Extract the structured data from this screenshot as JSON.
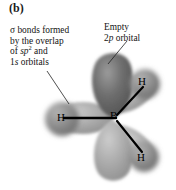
{
  "figure": {
    "panel_label": "(b)",
    "background_color": "#ffffff",
    "width": 176,
    "height": 190
  },
  "captions": {
    "left": {
      "name": "sigma-bond-caption",
      "lines": [
        {
          "prefix": "σ bonds formed",
          "italic": "",
          "sup": "",
          "suffix": ""
        },
        {
          "prefix": "by the overlap",
          "italic": "",
          "sup": "",
          "suffix": ""
        },
        {
          "prefix": "of ",
          "italic": "sp",
          "sup": "2",
          "suffix": " and"
        },
        {
          "prefix": "1",
          "italic": "s",
          "sup": "",
          "suffix": " orbitals"
        }
      ],
      "plain_text": "σ bonds formed by the overlap of sp2 and 1s orbitals"
    },
    "right": {
      "name": "empty-p-orbital-caption",
      "lines": [
        {
          "prefix": "Empty",
          "italic": "",
          "sup": "",
          "suffix": ""
        },
        {
          "prefix": "2",
          "italic": "p",
          "sup": "",
          "suffix": " orbital"
        }
      ],
      "plain_text": "Empty 2p orbital"
    }
  },
  "molecule": {
    "name": "boron-trihydride-sp2-orbital-diagram",
    "central_atom": {
      "label": "B",
      "x": 115,
      "y": 117
    },
    "hydrogens": [
      {
        "label": "H",
        "position": "left",
        "x": 62,
        "y": 117
      },
      {
        "label": "H",
        "position": "upper-right",
        "x": 143,
        "y": 82
      },
      {
        "label": "H",
        "position": "lower-right",
        "x": 142,
        "y": 158
      }
    ],
    "orbitals": {
      "p_orbital": {
        "label": "2p",
        "lobes": [
          "up",
          "down"
        ],
        "fill": "#6e6e6e",
        "state": "empty"
      },
      "sp2_orbitals": {
        "label": "sp2",
        "count": 3,
        "fill": "#a8a8a8"
      },
      "s_orbitals": {
        "label": "1s",
        "count": 3,
        "fill": "#9a9a9a"
      }
    },
    "bonds": [
      {
        "from": "B",
        "to": "H-left"
      },
      {
        "from": "B",
        "to": "H-upper-right"
      },
      {
        "from": "B",
        "to": "H-lower-right"
      }
    ]
  },
  "leader_lines": [
    {
      "name": "leader-line-sigma",
      "from_caption": "left",
      "to_target": "left-sp2-s-overlap"
    },
    {
      "name": "leader-line-2p",
      "from_caption": "right",
      "to_target": "upper-p-lobe"
    }
  ],
  "colors": {
    "p_lobe_dark": "#6a6a6a",
    "sp2_lobe_mid": "#a5a5a5",
    "h_sphere": "#8f8f8f",
    "bond_line": "#000000",
    "text": "#141414"
  }
}
